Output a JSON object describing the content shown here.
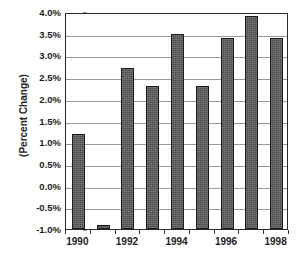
{
  "chart_data": {
    "type": "bar",
    "title": "",
    "subtitle": "",
    "xlabel": "",
    "ylabel": "(Percent Change)",
    "categories": [
      "1990",
      "1991",
      "1992",
      "1993",
      "1994",
      "1995",
      "1996",
      "1997",
      "1998"
    ],
    "values": [
      1.2,
      -0.9,
      2.7,
      2.3,
      3.5,
      2.3,
      3.4,
      3.9,
      3.4
    ],
    "value_labels": [
      "1.2%",
      "-0.9%",
      "2.7%",
      "2.3%",
      "3.5%",
      "2.3%",
      "3.4%",
      "3.9%",
      "3.4%"
    ],
    "series": [
      {
        "name": "Percent Change",
        "values": [
          1.2,
          -0.9,
          2.7,
          2.3,
          3.5,
          2.3,
          3.4,
          3.9,
          3.4
        ]
      }
    ],
    "ylim": [
      -1.0,
      4.0
    ],
    "ytick_values": [
      4.0,
      3.5,
      3.0,
      2.5,
      2.0,
      1.5,
      1.0,
      0.5,
      0.0,
      -0.5,
      -1.0
    ],
    "ytick_labels": [
      "4.0%",
      "3.5%",
      "3.0%",
      "2.5%",
      "2.0%",
      "1.5%",
      "1.0%",
      "0.5%",
      "0.0%",
      "-0.5%",
      "-1.0%"
    ],
    "xtick_labels": [
      "1990",
      "1992",
      "1994",
      "1996",
      "1998"
    ],
    "xtick_label_categories": [
      "1990",
      "1992",
      "1994",
      "1996",
      "1998"
    ],
    "grid": "horizontal",
    "legend": "none",
    "legend_position": "none",
    "bar_color": "#5c5c5c",
    "bar_edge_color": "#1a1a1a",
    "gridline_color": "#9a9a9a",
    "axis_color": "#2a2a2a",
    "background_color": "#ffffff",
    "baseline": -1.0,
    "annotations": []
  },
  "axes": {
    "y_title": "(Percent Change)"
  }
}
